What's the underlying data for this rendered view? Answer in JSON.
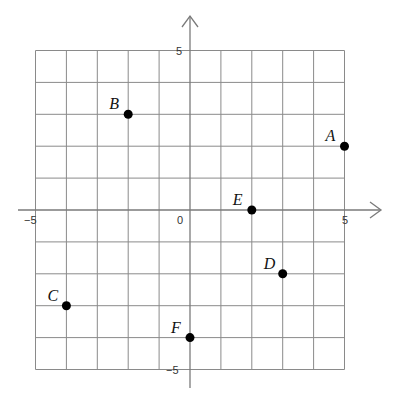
{
  "chart_data": {
    "type": "scatter",
    "title": "",
    "xlabel": "",
    "ylabel": "",
    "xlim": [
      -5,
      5
    ],
    "ylim": [
      -5,
      5
    ],
    "grid": true,
    "grid_step": 1,
    "tick_labels": {
      "x_min": "−5",
      "x_max": "5",
      "y_max": "5",
      "y_min": "−5",
      "origin": "0"
    },
    "points": [
      {
        "label": "A",
        "x": 5,
        "y": 2
      },
      {
        "label": "B",
        "x": -2,
        "y": 3
      },
      {
        "label": "C",
        "x": -4,
        "y": -3
      },
      {
        "label": "D",
        "x": 3,
        "y": -2
      },
      {
        "label": "E",
        "x": 2,
        "y": 0
      },
      {
        "label": "F",
        "x": 0,
        "y": -4
      }
    ]
  },
  "colors": {
    "grid": "#8a8a8a",
    "axis": "#7a7a7a",
    "point": "#000000",
    "background": "#ffffff"
  }
}
